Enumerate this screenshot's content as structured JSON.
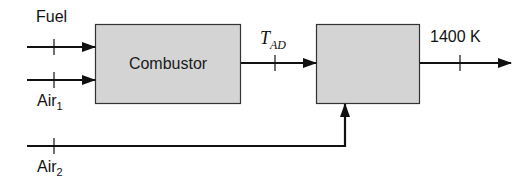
{
  "diagram": {
    "inputs": {
      "fuel": {
        "label": "Fuel"
      },
      "air1": {
        "label": "Air",
        "subscript": "1"
      },
      "air2": {
        "label": "Air",
        "subscript": "2"
      }
    },
    "blocks": [
      {
        "id": "combustor",
        "label": "Combustor"
      },
      {
        "id": "mixer",
        "label": ""
      }
    ],
    "intermediate": {
      "label": "T",
      "subscript": "AD"
    },
    "output": {
      "label": "1400 K"
    },
    "colors": {
      "box_fill": "#d4d4d4",
      "box_stroke": "#333333",
      "line": "#111111"
    }
  }
}
